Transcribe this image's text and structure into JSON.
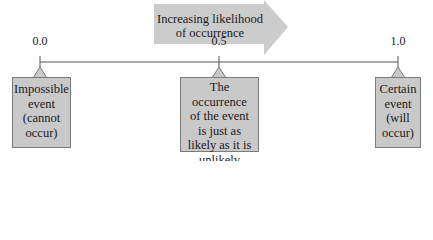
{
  "diagram": {
    "arrow": {
      "line1": "Increasing likelihood",
      "line2": "of occurrence",
      "fill": "#cccccc"
    },
    "scale": {
      "ticks": [
        {
          "label": "0.0",
          "x": 40
        },
        {
          "label": "0.5",
          "x": 219
        },
        {
          "label": "1.0",
          "x": 398
        }
      ],
      "line_color": "#555555"
    },
    "callouts": [
      {
        "lines": [
          "Impossible",
          "event",
          "(cannot",
          "occur)"
        ]
      },
      {
        "lines": [
          "The occurrence",
          "of the event",
          "is just as",
          "likely as it is",
          "unlikely"
        ]
      },
      {
        "lines": [
          "Certain",
          "event",
          "(will",
          "occur)"
        ]
      }
    ],
    "box_fill": "#c9c9c9"
  }
}
